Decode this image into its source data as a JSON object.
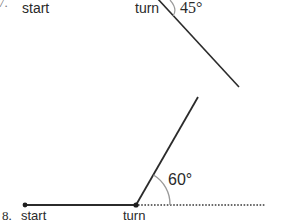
{
  "colors": {
    "line": "#2b2b2b",
    "arc": "#9a9a9a",
    "dotted": "#3a3a3a",
    "text": "#2a2a2a"
  },
  "problem7": {
    "number": "7.",
    "start_label": "start",
    "turn_label": "turn",
    "angle_label": "45°",
    "angle_degrees": 45
  },
  "problem8": {
    "number": "8.",
    "start_label": "start",
    "turn_label": "turn",
    "angle_label": "60°",
    "angle_degrees": 60
  }
}
